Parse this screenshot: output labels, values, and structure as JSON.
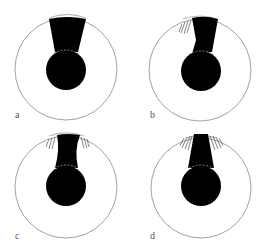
{
  "figure": {
    "panels": [
      {
        "id": "a",
        "label": "a",
        "label_pos": [
          15,
          110
        ]
      },
      {
        "id": "b",
        "label": "b",
        "label_pos": [
          150,
          110
        ]
      },
      {
        "id": "c",
        "label": "c",
        "label_pos": [
          15,
          231
        ]
      },
      {
        "id": "d",
        "label": "d",
        "label_pos": [
          150,
          231
        ]
      }
    ],
    "colors": {
      "outline": "#8a8a8a",
      "fill": "#000000",
      "background": "#ffffff",
      "dashed": "#9a9a9a"
    }
  }
}
